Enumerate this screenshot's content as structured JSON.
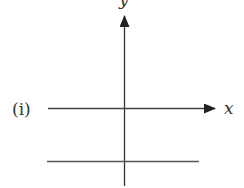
{
  "figure": {
    "part_label": "(i)",
    "x_axis_label": "x",
    "y_axis_label": "y",
    "colors": {
      "axis": "#333333",
      "line": "#555555",
      "background": "#ffffff"
    }
  }
}
